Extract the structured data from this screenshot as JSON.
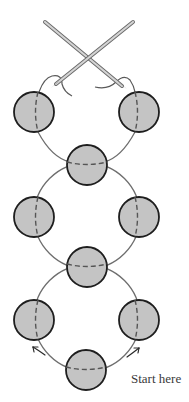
{
  "diagram": {
    "type": "right-angle-weave beading diagram",
    "colors": {
      "background": "#ffffff",
      "bead_fill": "#c4c4c4",
      "bead_stroke": "#1e1e1e",
      "thread": "#6e6e6e",
      "needle_fill": "#cfcfcf",
      "needle_stroke": "#6a6a6a",
      "text": "#3a3a3a"
    },
    "beads": [
      {
        "id": "top-left",
        "cx": 34,
        "cy": 112,
        "r": 20,
        "thread_dir": "vertical"
      },
      {
        "id": "top-right",
        "cx": 139,
        "cy": 112,
        "r": 20,
        "thread_dir": "vertical"
      },
      {
        "id": "middle-1",
        "cx": 87,
        "cy": 165,
        "r": 20,
        "thread_dir": "horizontal"
      },
      {
        "id": "left-2",
        "cx": 34,
        "cy": 217,
        "r": 20,
        "thread_dir": "vertical"
      },
      {
        "id": "right-2",
        "cx": 139,
        "cy": 217,
        "r": 20,
        "thread_dir": "vertical"
      },
      {
        "id": "middle-2",
        "cx": 87,
        "cy": 267,
        "r": 20,
        "thread_dir": "horizontal"
      },
      {
        "id": "bottom-left",
        "cx": 34,
        "cy": 320,
        "r": 20,
        "thread_dir": "vertical"
      },
      {
        "id": "bottom-right",
        "cx": 139,
        "cy": 320,
        "r": 20,
        "thread_dir": "vertical"
      },
      {
        "id": "bottom",
        "cx": 86,
        "cy": 370,
        "r": 20,
        "thread_dir": "horizontal"
      }
    ],
    "annotations": {
      "start_label": "Start here",
      "arrows": [
        "left-arrow-up",
        "right-arrow-up"
      ]
    }
  }
}
